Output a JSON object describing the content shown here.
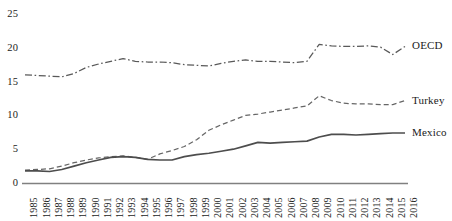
{
  "chart_data": {
    "type": "line",
    "title": "",
    "subtitle": "",
    "xlabel": "",
    "ylabel": "",
    "grid": false,
    "legend_position": "right-inline-end-of-line",
    "xlim": [
      1985,
      2016
    ],
    "ylim": [
      0,
      25
    ],
    "ytick_values": [
      0,
      5,
      10,
      15,
      20,
      25
    ],
    "ytick_labels": [
      "0",
      "5",
      "10",
      "15",
      "20",
      "25"
    ],
    "x": [
      1985,
      1986,
      1987,
      1988,
      1989,
      1990,
      1991,
      1992,
      1993,
      1994,
      1995,
      1996,
      1997,
      1998,
      1999,
      2000,
      2001,
      2002,
      2003,
      2004,
      2005,
      2006,
      2007,
      2008,
      2009,
      2010,
      2011,
      2012,
      2013,
      2014,
      2015,
      2016
    ],
    "xtick_labels": [
      "1985",
      "1986",
      "1987",
      "1988",
      "1989",
      "1990",
      "1991",
      "1992",
      "1993",
      "1994",
      "1995",
      "1996",
      "1997",
      "1998",
      "1999",
      "2000",
      "2001",
      "2002",
      "2003",
      "2004",
      "2005",
      "2006",
      "2007",
      "2008",
      "2009",
      "2010",
      "2011",
      "2012",
      "2013",
      "2014",
      "2015",
      "2016"
    ],
    "series": [
      {
        "name": "OECD",
        "label": "OECD",
        "style": "dash-dot",
        "color": "#595959",
        "values": [
          16.0,
          15.9,
          15.8,
          15.7,
          16.2,
          17.1,
          17.6,
          18.0,
          18.4,
          18.0,
          17.9,
          17.9,
          17.8,
          17.5,
          17.4,
          17.3,
          17.7,
          18.0,
          18.2,
          18.0,
          18.0,
          17.9,
          17.8,
          18.0,
          20.5,
          20.3,
          20.2,
          20.2,
          20.3,
          20.1,
          19.0,
          20.2
        ]
      },
      {
        "name": "Turkey",
        "label": "Turkey",
        "style": "dashed",
        "color": "#666666",
        "values": [
          1.9,
          2.0,
          2.1,
          2.5,
          3.0,
          3.4,
          3.7,
          3.9,
          4.0,
          3.8,
          3.5,
          4.3,
          4.8,
          5.4,
          6.4,
          7.8,
          8.6,
          9.3,
          10.0,
          10.2,
          10.5,
          10.8,
          11.1,
          11.4,
          12.9,
          12.2,
          11.8,
          11.7,
          11.7,
          11.6,
          11.6,
          12.2
        ]
      },
      {
        "name": "Mexico",
        "label": "Mexico",
        "style": "solid",
        "color": "#4d4d4d",
        "values": [
          1.8,
          1.8,
          1.7,
          2.0,
          2.5,
          3.0,
          3.4,
          3.8,
          3.9,
          3.8,
          3.5,
          3.4,
          3.4,
          3.9,
          4.2,
          4.4,
          4.7,
          5.0,
          5.5,
          6.0,
          5.9,
          6.0,
          6.1,
          6.2,
          6.8,
          7.2,
          7.2,
          7.1,
          7.2,
          7.3,
          7.4,
          7.4
        ]
      }
    ]
  },
  "axes": {
    "axis_line_color": "#808080"
  }
}
